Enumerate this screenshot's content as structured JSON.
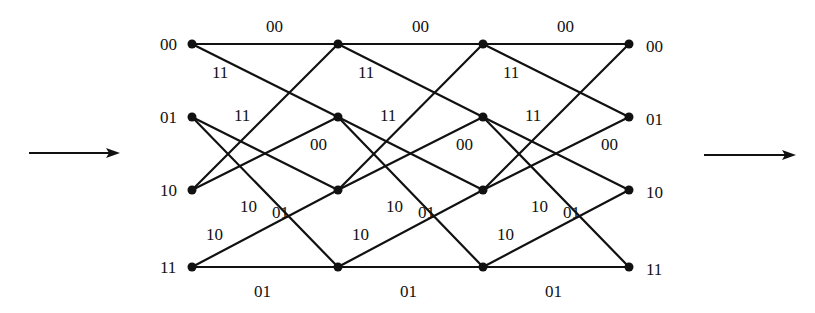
{
  "diagram": {
    "type": "trellis",
    "states": [
      "00",
      "01",
      "10",
      "11"
    ],
    "columns_x": [
      192,
      338,
      483,
      629
    ],
    "rows_y": {
      "00": 44,
      "01": 117,
      "10": 190,
      "11": 267
    },
    "left_state_labels": [
      "00",
      "01",
      "10",
      "11"
    ],
    "right_state_labels": [
      "00",
      "01",
      "10",
      "11"
    ],
    "transitions": [
      {
        "from": "00",
        "to": "00",
        "output": "00"
      },
      {
        "from": "00",
        "to": "01",
        "output": "11"
      },
      {
        "from": "01",
        "to": "10",
        "output": "01"
      },
      {
        "from": "01",
        "to": "11",
        "output": "10"
      },
      {
        "from": "10",
        "to": "00",
        "output": "11"
      },
      {
        "from": "10",
        "to": "01",
        "output": "00"
      },
      {
        "from": "11",
        "to": "10",
        "output": "10"
      },
      {
        "from": "11",
        "to": "11",
        "output": "01"
      }
    ],
    "stages": [
      {
        "labels": {
          "00_00": "00",
          "00_01": "11",
          "10_00": "11",
          "10_01": "00",
          "01_10": "01",
          "01_11": "10",
          "11_10": "10",
          "11_11": "01"
        }
      },
      {
        "labels": {
          "00_00": "00",
          "00_01": "11",
          "10_00": "11",
          "10_01": "00",
          "01_10": "01",
          "01_11": "10",
          "11_10": "10",
          "11_11": "01"
        }
      },
      {
        "labels": {
          "00_00": "00",
          "00_01": "11",
          "10_00": "11",
          "10_01": "00",
          "01_10": "01",
          "01_11": "10",
          "11_10": "10",
          "11_11": "01"
        }
      }
    ],
    "input_arrow": {
      "direction": "right"
    },
    "output_arrow": {
      "direction": "right"
    }
  }
}
